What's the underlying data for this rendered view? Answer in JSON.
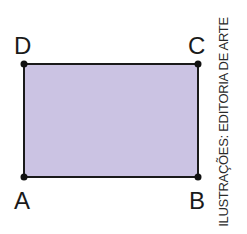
{
  "diagram": {
    "shape": "rectangle",
    "fill_color": "#cbc3e3",
    "stroke_color": "#1a1a1a",
    "vertices": [
      {
        "label": "A",
        "x": 24,
        "y": 177
      },
      {
        "label": "B",
        "x": 198,
        "y": 177
      },
      {
        "label": "C",
        "x": 198,
        "y": 64
      },
      {
        "label": "D",
        "x": 24,
        "y": 64
      }
    ]
  },
  "labels": {
    "A": "A",
    "B": "B",
    "C": "C",
    "D": "D"
  },
  "credit": "ILUSTRAÇÕES: EDITORIA DE ARTE"
}
